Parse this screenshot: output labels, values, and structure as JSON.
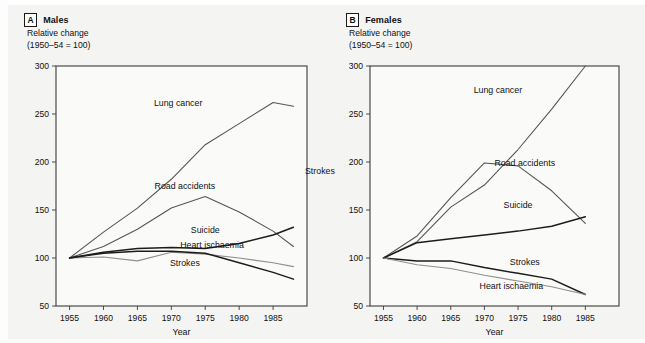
{
  "figure": {
    "background_color": "#f4f4f2",
    "panels": [
      {
        "letter": "A",
        "title": "Males",
        "caption": "Relative change\n(1950–54 = 100)"
      },
      {
        "letter": "B",
        "title": "Females",
        "caption": "Relative change\n(1950–54 = 100)"
      }
    ],
    "floating_label": "Strokes"
  },
  "chart_data": [
    {
      "type": "line",
      "title": "Males",
      "subtitle": "Relative change (1950–54 = 100)",
      "xlabel": "Year",
      "ylabel": "Relative change (1950–54 = 100)",
      "xlim": [
        1953,
        1990
      ],
      "ylim": [
        50,
        300
      ],
      "xticks": [
        1955,
        1960,
        1965,
        1970,
        1975,
        1980,
        1985
      ],
      "yticks": [
        50,
        100,
        150,
        200,
        250,
        300
      ],
      "grid": false,
      "legend_position": "inline-labels",
      "series": [
        {
          "name": "Lung cancer",
          "color": "#55565a",
          "width": 1.1,
          "label_x": 1971,
          "label_y": 258,
          "x": [
            1955,
            1960,
            1965,
            1970,
            1975,
            1980,
            1985,
            1988
          ],
          "values": [
            100,
            127,
            152,
            182,
            218,
            240,
            262,
            258
          ]
        },
        {
          "name": "Road accidents",
          "color": "#55565a",
          "width": 1.1,
          "label_x": 1972,
          "label_y": 172,
          "x": [
            1955,
            1960,
            1965,
            1970,
            1975,
            1980,
            1985,
            1988
          ],
          "values": [
            100,
            112,
            130,
            152,
            164,
            148,
            128,
            112
          ]
        },
        {
          "name": "Suicide",
          "color": "#1c1c1c",
          "width": 1.5,
          "label_x": 1975,
          "label_y": 126,
          "x": [
            1955,
            1960,
            1965,
            1970,
            1975,
            1980,
            1985,
            1988
          ],
          "values": [
            100,
            106,
            110,
            111,
            110,
            115,
            124,
            132
          ]
        },
        {
          "name": "Heart ischaemia",
          "color": "#8d8e90",
          "width": 1.1,
          "label_x": 1976,
          "label_y": 110,
          "x": [
            1955,
            1960,
            1965,
            1970,
            1975,
            1980,
            1985,
            1988
          ],
          "values": [
            100,
            101,
            97,
            106,
            104,
            100,
            95,
            91
          ]
        },
        {
          "name": "Strokes",
          "color": "#1c1c1c",
          "width": 1.5,
          "label_x": 1972,
          "label_y": 92,
          "x": [
            1955,
            1960,
            1965,
            1970,
            1975,
            1980,
            1985,
            1988
          ],
          "values": [
            100,
            105,
            107,
            107,
            105,
            95,
            85,
            78
          ]
        }
      ]
    },
    {
      "type": "line",
      "title": "Females",
      "subtitle": "Relative change (1950–54 = 100)",
      "xlabel": "Year",
      "ylabel": "Relative change (1950–54 = 100)",
      "xlim": [
        1953,
        1990
      ],
      "ylim": [
        50,
        300
      ],
      "xticks": [
        1955,
        1960,
        1965,
        1970,
        1975,
        1980,
        1985
      ],
      "yticks": [
        50,
        100,
        150,
        200,
        250,
        300
      ],
      "grid": false,
      "legend_position": "inline-labels",
      "series": [
        {
          "name": "Lung cancer",
          "color": "#55565a",
          "width": 1.1,
          "label_x": 1972,
          "label_y": 272,
          "x": [
            1955,
            1960,
            1965,
            1970,
            1975,
            1980,
            1985
          ],
          "values": [
            100,
            117,
            153,
            176,
            213,
            255,
            300
          ]
        },
        {
          "name": "Road accidents",
          "color": "#55565a",
          "width": 1.1,
          "label_x": 1976,
          "label_y": 196,
          "x": [
            1955,
            1960,
            1965,
            1970,
            1975,
            1980,
            1985
          ],
          "values": [
            100,
            123,
            163,
            199,
            196,
            170,
            136
          ]
        },
        {
          "name": "Suicide",
          "color": "#1c1c1c",
          "width": 1.5,
          "label_x": 1975,
          "label_y": 152,
          "x": [
            1955,
            1960,
            1965,
            1970,
            1975,
            1980,
            1985
          ],
          "values": [
            100,
            116,
            120,
            124,
            128,
            133,
            143
          ]
        },
        {
          "name": "Strokes",
          "color": "#1c1c1c",
          "width": 1.5,
          "label_x": 1976,
          "label_y": 93,
          "x": [
            1955,
            1960,
            1965,
            1970,
            1975,
            1980,
            1985
          ],
          "values": [
            100,
            97,
            97,
            90,
            84,
            78,
            62
          ]
        },
        {
          "name": "Heart ischaemia",
          "color": "#8d8e90",
          "width": 1.1,
          "label_x": 1974,
          "label_y": 68,
          "x": [
            1955,
            1960,
            1965,
            1970,
            1975,
            1980,
            1985
          ],
          "values": [
            100,
            93,
            89,
            82,
            76,
            70,
            62
          ]
        }
      ]
    }
  ]
}
